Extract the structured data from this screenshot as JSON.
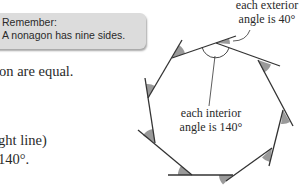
{
  "callout": {
    "title": "Remember:",
    "text": "A nonagon has nine sides."
  },
  "body": {
    "line1": "on are equal.",
    "line2": ".",
    "line3": "ght line)",
    "line4": " 140°."
  },
  "diagram": {
    "shape": "regular nonagon",
    "sides": 9,
    "exterior_label_line1": "each exterior",
    "exterior_label_line2": "angle is 40°",
    "interior_label_line1": "each interior",
    "interior_label_line2": "angle is 140°",
    "exterior_angle_deg": 40,
    "interior_angle_deg": 140,
    "colors": {
      "line": "#333333",
      "angle_fill": "#9a9a9a",
      "callout_bg": "#dcdcdc"
    }
  }
}
